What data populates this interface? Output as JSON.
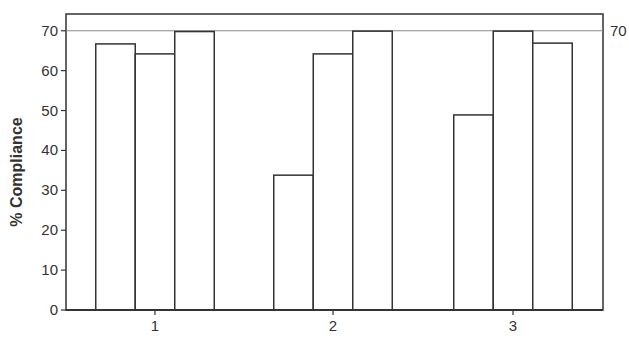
{
  "chart_data": {
    "type": "bar",
    "title": "",
    "xlabel": "",
    "ylabel": "% Compliance",
    "categories": [
      "1",
      "2",
      "3"
    ],
    "series": [
      {
        "name": "Series 1",
        "values": [
          66.7,
          33.8,
          48.9
        ]
      },
      {
        "name": "Series 2",
        "values": [
          64.2,
          64.2,
          69.9
        ]
      },
      {
        "name": "Series 3",
        "values": [
          69.8,
          69.9,
          66.9
        ]
      }
    ],
    "ylim": [
      0,
      74.2
    ],
    "yticks": [
      0,
      10,
      20,
      30,
      40,
      50,
      60,
      70
    ],
    "reference_line": {
      "value": 70,
      "label": "70"
    },
    "grid": false,
    "legend": null,
    "colors": {
      "bar_fill": "#ffffff",
      "bar_stroke": "#333333",
      "axis": "#333333",
      "reference_line": "#888888"
    }
  }
}
